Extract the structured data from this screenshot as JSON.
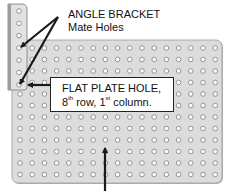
{
  "diagram": {
    "labels": {
      "angle_bracket_line1": "ANGLE BRACKET",
      "angle_bracket_line2": "Mate Holes",
      "callout_line1": "FLAT PLATE HOLE,",
      "callout_row_num": "8",
      "callout_row_sup": "th",
      "callout_row_text": " row, 1",
      "callout_col_sup": "st",
      "callout_col_text": " column."
    },
    "flat_plate": {
      "x": 12,
      "y": 40,
      "width": 210,
      "height": 143,
      "columns": 17,
      "rows": 12,
      "hole_start_x": 20,
      "hole_start_y": 48,
      "hole_spacing_x": 12.2,
      "hole_spacing_y": 11.5,
      "fill": "#dcdcdc",
      "edge": "#9a9a9a"
    },
    "angle_bracket": {
      "x": 8,
      "y": 4,
      "width": 19,
      "height": 86,
      "holes": 7,
      "hole_x": 19,
      "hole_start_y": 11,
      "hole_spacing_y": 12.3,
      "fill": "#e2e2e2",
      "edge": "#7a7a7a"
    },
    "hole": {
      "radius": 2.3,
      "fill": "#ffffff",
      "ring": "#8a8a8a"
    },
    "arrows": [
      {
        "name": "arrow-to-bracket-hole-top",
        "from": [
          58,
          17
        ],
        "to": [
          21,
          47
        ]
      },
      {
        "name": "arrow-to-bracket-hole-bottom",
        "from": [
          58,
          17
        ],
        "to": [
          20,
          84
        ]
      },
      {
        "name": "arrow-callout-to-hole",
        "from": [
          50,
          85
        ],
        "to": [
          28,
          85
        ]
      },
      {
        "name": "arrow-up-to-plate",
        "from": [
          105,
          191
        ],
        "to": [
          105,
          148
        ]
      }
    ],
    "colors": {
      "arrow": "#1a1a1a",
      "callout_border": "#222222"
    }
  }
}
